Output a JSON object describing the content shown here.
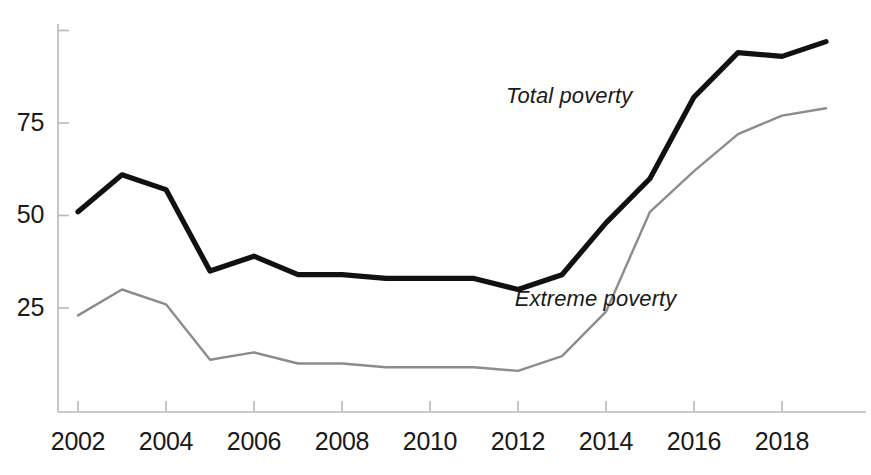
{
  "chart_data": {
    "type": "line",
    "title": "",
    "subtitle": "",
    "xlabel": "",
    "ylabel": "",
    "x": [
      2002,
      2003,
      2004,
      2005,
      2006,
      2007,
      2008,
      2009,
      2010,
      2011,
      2012,
      2013,
      2014,
      2015,
      2016,
      2017,
      2018,
      2019
    ],
    "xlim": [
      2002,
      2019
    ],
    "ylim": [
      0,
      100
    ],
    "xticks": [
      2002,
      2004,
      2006,
      2008,
      2010,
      2012,
      2014,
      2016,
      2018
    ],
    "xtick_labels": [
      "2002",
      "2004",
      "2006",
      "2008",
      "2010",
      "2012",
      "2014",
      "2016",
      "2018"
    ],
    "yticks": [
      25,
      50,
      75,
      100
    ],
    "ytick_labels": [
      "25",
      "50",
      "75",
      ""
    ],
    "grid": false,
    "legend_position": "inline-annotation",
    "series": [
      {
        "name": "Total poverty",
        "color": "#111111",
        "line_width": 5.2,
        "label_x": 2014.6,
        "label_y": 80.5,
        "values": [
          51,
          61,
          57,
          35,
          39,
          34,
          34,
          33,
          33,
          33,
          30,
          34,
          48,
          60,
          82,
          94,
          93,
          97
        ]
      },
      {
        "name": "Extreme poverty",
        "color": "#8c8c8c",
        "line_width": 2.4,
        "label_x": 2015.6,
        "label_y": 25.5,
        "values": [
          23,
          30,
          26,
          11,
          13,
          10,
          10,
          9,
          9,
          9,
          8,
          12,
          24,
          51,
          62,
          72,
          77,
          79
        ]
      }
    ]
  }
}
